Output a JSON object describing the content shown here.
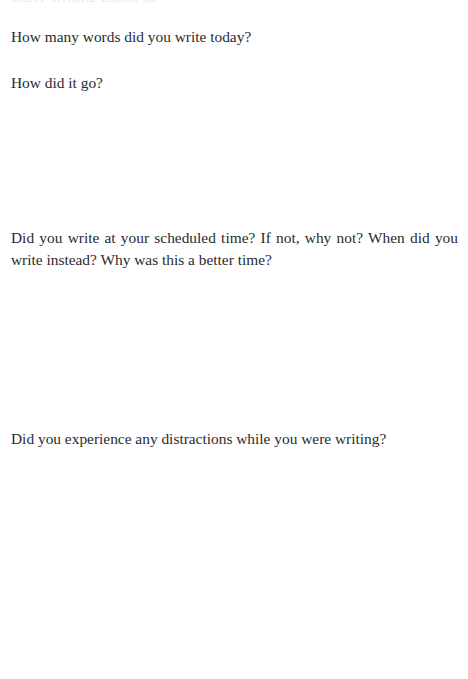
{
  "page": {
    "background_color": "#ffffff",
    "text_color": "#2a2a2e",
    "clipped_top_line": "Daily writing check-in",
    "prompts": [
      {
        "id": "word-count",
        "text": "How many words did you write today?"
      },
      {
        "id": "how-did-it-go",
        "text": "How did it go?"
      },
      {
        "id": "scheduled-time",
        "text": "Did you write at your scheduled time? If not, why not? When did you write instead? Why was this a better time?"
      },
      {
        "id": "distractions",
        "text": "Did you experience any distractions while you were writing?"
      }
    ],
    "answer_spaces": [
      {
        "id": "answer-how-did-it-go",
        "value": ""
      },
      {
        "id": "answer-scheduled-time",
        "value": ""
      },
      {
        "id": "answer-distractions",
        "value": ""
      }
    ]
  }
}
